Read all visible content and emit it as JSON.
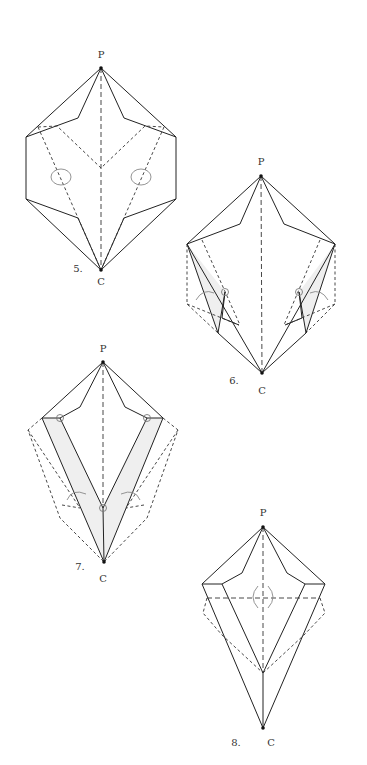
{
  "figures": [
    {
      "step": "5.",
      "top_label": "P",
      "bottom_label": "C"
    },
    {
      "step": "6.",
      "top_label": "P",
      "bottom_label": "C"
    },
    {
      "step": "7.",
      "top_label": "P",
      "bottom_label": "C"
    },
    {
      "step": "8.",
      "top_label": "P",
      "bottom_label": "C"
    }
  ],
  "colors": {
    "line": "#222222",
    "shade": "#efefef",
    "arrow": "#888888"
  }
}
